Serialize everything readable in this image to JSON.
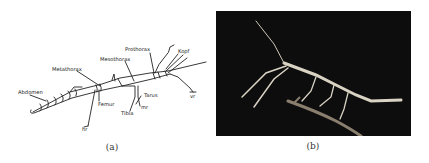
{
  "figure": {
    "panels": [
      {
        "id": "a",
        "caption": "(a)",
        "type": "line-diagram",
        "subject": "stick insect anatomy",
        "labels": {
          "abdomen": "Abdomen",
          "metathorax": "Metathorax",
          "mesothorax": "Mesothorax",
          "prothorax": "Prothorax",
          "kopf": "Kopf",
          "femur": "Femur",
          "tibia": "Tibia",
          "tarus": "Tarus",
          "hr": "hr",
          "mr": "mr",
          "vr": "vr"
        }
      },
      {
        "id": "b",
        "caption": "(b)",
        "type": "photograph",
        "subject": "stick insect on a twig, dark background"
      }
    ],
    "colors": {
      "line": "#222222",
      "photo_background": "#0d0d0d",
      "insect": "#d9d3c4",
      "twig": "#8a7f6e"
    }
  }
}
